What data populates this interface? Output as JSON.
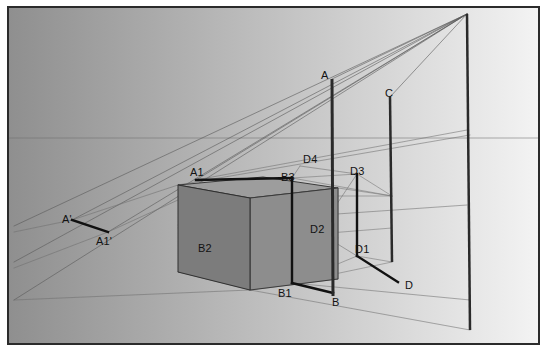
{
  "figure": {
    "kind": "perspective-projection-diagram",
    "title_text": "",
    "frame": {
      "x": 7,
      "y": 6,
      "width": 533,
      "height": 339,
      "border_color": "#2b2b2b",
      "border_width": 2
    },
    "background": {
      "gradient_from": "#8f8f8f",
      "gradient_to": "#f4f4f4",
      "gradient_direction": "left-to-right",
      "sky_band_color": "#9a9a9a",
      "ground_band_color": "#989898",
      "horizon_y": 138,
      "horizon_color": "#6f6f6f"
    },
    "colors": {
      "box_front_face": "#7c7c7c",
      "box_top_face": "#9d9d9d",
      "box_right_face": "#8d8d8d",
      "heavy_line": "#111111",
      "construction_line": "#5a5a5a",
      "pole_line": "#2a2a2a",
      "thin_guide": "#707070"
    },
    "vanishing_point": {
      "label": "",
      "x": 467,
      "y": 14
    },
    "labels": [
      {
        "name": "A",
        "text": "A",
        "x": 319,
        "y": 68
      },
      {
        "name": "C",
        "text": "C",
        "x": 383,
        "y": 86
      },
      {
        "name": "A1",
        "text": "A1",
        "x": 188,
        "y": 165
      },
      {
        "name": "B3",
        "text": "B3",
        "x": 279,
        "y": 170
      },
      {
        "name": "D4",
        "text": "D4",
        "x": 301,
        "y": 152
      },
      {
        "name": "D3",
        "text": "D3",
        "x": 348,
        "y": 164
      },
      {
        "name": "D2",
        "text": "D2",
        "x": 308,
        "y": 222
      },
      {
        "name": "D1",
        "text": "D1",
        "x": 353,
        "y": 242
      },
      {
        "name": "B2",
        "text": "B2",
        "x": 196,
        "y": 241
      },
      {
        "name": "B1",
        "text": "B1",
        "x": 276,
        "y": 286
      },
      {
        "name": "B",
        "text": "B",
        "x": 330,
        "y": 295
      },
      {
        "name": "D",
        "text": "D",
        "x": 403,
        "y": 278
      },
      {
        "name": "Aprime",
        "text": "A'",
        "x": 60,
        "y": 212
      },
      {
        "name": "A1prime",
        "text": "A1'",
        "x": 94,
        "y": 234
      }
    ],
    "poles": [
      {
        "name": "pole-A",
        "top_x": 332,
        "top_y": 79,
        "bottom_x": 333,
        "bottom_y": 296,
        "width": 3
      },
      {
        "name": "pole-C",
        "top_x": 390,
        "top_y": 97,
        "bottom_x": 392,
        "bottom_y": 262,
        "width": 2.5
      },
      {
        "name": "pole-vanishing",
        "top_x": 467,
        "top_y": 14,
        "bottom_x": 470,
        "bottom_y": 330,
        "width": 2.5
      }
    ],
    "box": {
      "name": "shaded-box",
      "top_face": "178,185 263,177 338,188 250,198",
      "front_face": "178,185 178,272 250,290 250,198",
      "right_face": "250,198 338,188 338,279 250,290"
    },
    "heavy_segments": [
      {
        "name": "seg-A1-B3",
        "x1": 196,
        "y1": 180,
        "x2": 292,
        "y2": 178
      },
      {
        "name": "seg-B3-B1",
        "x1": 292,
        "y1": 178,
        "x2": 292,
        "y2": 283
      },
      {
        "name": "seg-B1-B",
        "x1": 292,
        "y1": 283,
        "x2": 333,
        "y2": 293
      },
      {
        "name": "seg-D3-D1",
        "x1": 357,
        "y1": 174,
        "x2": 357,
        "y2": 256
      },
      {
        "name": "seg-D1-D",
        "x1": 357,
        "y1": 256,
        "x2": 398,
        "y2": 282
      },
      {
        "name": "seg-Aprime-A1prime",
        "x1": 72,
        "y1": 220,
        "x2": 108,
        "y2": 232
      }
    ],
    "notes": {
      "caption": "",
      "description_hidden": "two-point perspective construction of a box with projection rays to a vanishing point"
    }
  }
}
